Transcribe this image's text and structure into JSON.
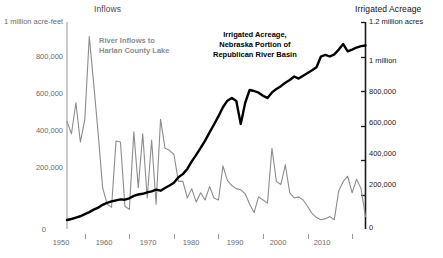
{
  "chart_data": {
    "type": "line",
    "title": "",
    "xlabel": "",
    "grid": false,
    "legend_position": "inline-annotations",
    "x_axis": {
      "range": [
        1946,
        2013
      ],
      "tick_values": [
        1950,
        1960,
        1970,
        1980,
        1990,
        2000,
        2010
      ],
      "tick_labels": [
        "1950",
        "1960",
        "1970",
        "1980",
        "1990",
        "2000",
        "2010"
      ]
    },
    "left_axis": {
      "title": "Inflows",
      "top_unit_label": "1 million acre-feet",
      "units": "acre-feet",
      "ylim": [
        0,
        1000000
      ],
      "tick_values": [
        0,
        200000,
        400000,
        600000,
        800000,
        1000000
      ],
      "tick_labels": [
        "0",
        "200,000",
        "400,000",
        "600,000",
        "800,000",
        "1 million acre-feet"
      ],
      "color": "#8c8c8c"
    },
    "right_axis": {
      "title": "Irrigated Acreage",
      "top_unit_label": "1.2 million acres",
      "units": "acres",
      "ylim": [
        0,
        1200000
      ],
      "tick_values": [
        0,
        200000,
        400000,
        600000,
        800000,
        1000000,
        1200000
      ],
      "tick_labels": [
        "0",
        "200,000",
        "400,000",
        "600,000",
        "800,000",
        "1 million",
        "1.2 million acres"
      ],
      "color": "#000000"
    },
    "annotations": [
      {
        "name": "inflows-label",
        "lines": [
          "River Inflows to",
          "Harlan County Lake"
        ],
        "color": "#8c8c8c",
        "x": 1957,
        "y": 880000
      },
      {
        "name": "acreage-label",
        "lines": [
          "Irrigated Acreage,",
          "Nebraska Portion of",
          "Republican River Basin"
        ],
        "color": "#000000",
        "x": 1985,
        "y": 1150000
      }
    ],
    "series": [
      {
        "name": "River Inflows to Harlan County Lake",
        "axis": "left",
        "color": "#8c8c8c",
        "stroke_width": 1.1,
        "x": [
          1946,
          1947,
          1948,
          1949,
          1950,
          1951,
          1952,
          1953,
          1954,
          1955,
          1956,
          1957,
          1958,
          1959,
          1960,
          1961,
          1962,
          1963,
          1964,
          1965,
          1966,
          1967,
          1968,
          1969,
          1970,
          1971,
          1972,
          1973,
          1974,
          1975,
          1976,
          1977,
          1978,
          1979,
          1980,
          1981,
          1982,
          1983,
          1984,
          1985,
          1986,
          1987,
          1988,
          1989,
          1990,
          1991,
          1992,
          1993,
          1994,
          1995,
          1996,
          1997,
          1998,
          1999,
          2000,
          2001,
          2002,
          2003,
          2004,
          2005,
          2006,
          2007,
          2008,
          2009,
          2010,
          2011,
          2012,
          2013
        ],
        "values": [
          520000,
          460000,
          610000,
          420000,
          530000,
          930000,
          700000,
          460000,
          200000,
          120000,
          105000,
          425000,
          420000,
          110000,
          95000,
          470000,
          200000,
          460000,
          150000,
          430000,
          120000,
          530000,
          390000,
          380000,
          360000,
          230000,
          230000,
          150000,
          195000,
          130000,
          175000,
          140000,
          205000,
          150000,
          140000,
          305000,
          235000,
          210000,
          195000,
          190000,
          170000,
          120000,
          80000,
          155000,
          140000,
          125000,
          390000,
          230000,
          215000,
          310000,
          175000,
          150000,
          155000,
          140000,
          110000,
          75000,
          55000,
          45000,
          50000,
          60000,
          45000,
          185000,
          230000,
          255000,
          175000,
          240000,
          195000,
          60000
        ]
      },
      {
        "name": "Irrigated Acreage, Nebraska Portion of Republican River Basin",
        "axis": "right",
        "color": "#000000",
        "stroke_width": 2.4,
        "x": [
          1946,
          1947,
          1948,
          1949,
          1950,
          1951,
          1952,
          1953,
          1954,
          1955,
          1956,
          1957,
          1958,
          1959,
          1960,
          1961,
          1962,
          1963,
          1964,
          1965,
          1966,
          1967,
          1968,
          1969,
          1970,
          1971,
          1972,
          1973,
          1974,
          1975,
          1976,
          1977,
          1978,
          1979,
          1980,
          1981,
          1982,
          1983,
          1984,
          1985,
          1986,
          1987,
          1988,
          1989,
          1990,
          1991,
          1992,
          1993,
          1994,
          1995,
          1996,
          1997,
          1998,
          1999,
          2000,
          2001,
          2002,
          2003,
          2004,
          2005,
          2006,
          2007,
          2008,
          2009,
          2010,
          2011,
          2012,
          2013
        ],
        "values": [
          52000,
          58000,
          66000,
          74000,
          86000,
          98000,
          112000,
          124000,
          140000,
          152000,
          160000,
          166000,
          172000,
          170000,
          178000,
          192000,
          200000,
          204000,
          212000,
          218000,
          228000,
          222000,
          238000,
          252000,
          268000,
          300000,
          318000,
          348000,
          392000,
          430000,
          470000,
          512000,
          560000,
          606000,
          654000,
          706000,
          744000,
          760000,
          742000,
          608000,
          732000,
          806000,
          800000,
          790000,
          772000,
          760000,
          792000,
          812000,
          828000,
          848000,
          864000,
          884000,
          872000,
          888000,
          904000,
          920000,
          938000,
          1000000,
          1010000,
          1000000,
          1012000,
          1040000,
          1072000,
          1030000,
          1040000,
          1052000,
          1060000,
          1064000
        ]
      }
    ]
  },
  "left_axis_title": "Inflows",
  "right_axis_title": "Irrigated Acreage",
  "left_top_unit": "1 million acre-feet",
  "right_top_unit": "1.2 million acres",
  "left_ticks": [
    "800,000",
    "600,000",
    "400,000",
    "200,000",
    "0"
  ],
  "right_ticks": [
    "1 million",
    "800,000",
    "600,000",
    "400,000",
    "200,000",
    "0"
  ],
  "x_ticks": [
    "1950",
    "1960",
    "1970",
    "1980",
    "1990",
    "2000",
    "2010"
  ],
  "annotation_inflows": {
    "line1": "River Inflows to",
    "line2": "Harlan County Lake"
  },
  "annotation_acreage": {
    "line1": "Irrigated Acreage,",
    "line2": "Nebraska Portion of",
    "line3": "Republican River Basin"
  },
  "colors": {
    "inflows": "#8c8c8c",
    "acreage": "#000000",
    "left_axis": "#bdbdbd",
    "right_axis": "#1a1a1a",
    "tick_text_left": "#6b6b6b",
    "tick_text_right": "#1a1a1a",
    "background": "#ffffff"
  }
}
